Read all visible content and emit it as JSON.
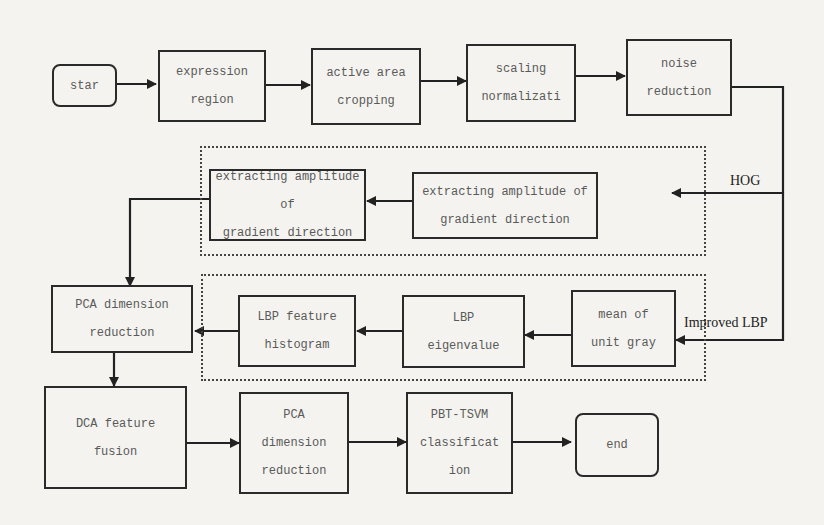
{
  "diagram": {
    "nodes": {
      "start": {
        "lines": [
          "star"
        ]
      },
      "expression_region": {
        "lines": [
          "expression",
          "region"
        ]
      },
      "active_area": {
        "lines": [
          "active area",
          "cropping"
        ]
      },
      "scaling": {
        "lines": [
          "scaling",
          "normalizati"
        ]
      },
      "noise": {
        "lines": [
          "noise",
          "reduction"
        ]
      },
      "hog_right": {
        "lines": [
          "extracting amplitude of",
          "gradient direction"
        ]
      },
      "hog_left": {
        "lines": [
          "extracting amplitude of",
          "gradient direction"
        ]
      },
      "pca1": {
        "lines": [
          "PCA dimension",
          "reduction"
        ]
      },
      "lbp_hist": {
        "lines": [
          "LBP feature",
          "histogram"
        ]
      },
      "lbp_eigen": {
        "lines": [
          "LBP",
          "eigenvalue"
        ]
      },
      "mean_gray": {
        "lines": [
          "mean of",
          "unit gray"
        ]
      },
      "dca": {
        "lines": [
          "DCA feature",
          "fusion"
        ]
      },
      "pca2": {
        "lines": [
          "PCA",
          "dimension",
          "reduction"
        ]
      },
      "classify": {
        "lines": [
          "PBT-TSVM",
          "classificat",
          "ion"
        ]
      },
      "end": {
        "lines": [
          "end"
        ]
      }
    },
    "branch_labels": {
      "hog": "HOG",
      "lbp": "Improved LBP"
    },
    "edges": [
      [
        "start",
        "expression_region"
      ],
      [
        "expression_region",
        "active_area"
      ],
      [
        "active_area",
        "scaling"
      ],
      [
        "scaling",
        "noise"
      ],
      [
        "noise",
        "hog_right"
      ],
      [
        "hog_right",
        "hog_left"
      ],
      [
        "hog_left",
        "pca1"
      ],
      [
        "noise",
        "mean_gray"
      ],
      [
        "mean_gray",
        "lbp_eigen"
      ],
      [
        "lbp_eigen",
        "lbp_hist"
      ],
      [
        "lbp_hist",
        "pca1"
      ],
      [
        "pca1",
        "dca"
      ],
      [
        "dca",
        "pca2"
      ],
      [
        "pca2",
        "classify"
      ],
      [
        "classify",
        "end"
      ]
    ]
  }
}
